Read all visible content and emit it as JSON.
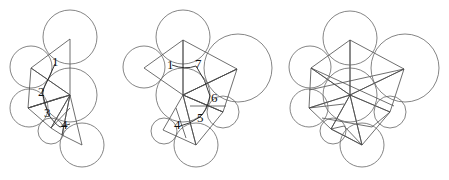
{
  "figure": {
    "colors": {
      "dark_face": "#6e6e6e",
      "light_face": "#cacaca",
      "medium_face": "#9b9b9b",
      "edge": "#4a4a4a",
      "circle": "#666666"
    },
    "panels": [
      {
        "id": "panel-1",
        "labels": [
          {
            "text": "1",
            "x": 52,
            "y": 66
          },
          {
            "text": "2",
            "x": 38,
            "y": 96
          },
          {
            "text": "3",
            "x": 44,
            "y": 117
          },
          {
            "text": "4",
            "x": 61,
            "y": 129
          }
        ]
      },
      {
        "id": "panel-2",
        "labels": [
          {
            "text": "1",
            "x": 167,
            "y": 69
          },
          {
            "text": "7",
            "x": 195,
            "y": 68
          },
          {
            "text": "6",
            "x": 211,
            "y": 102
          },
          {
            "text": "5",
            "x": 197,
            "y": 122
          },
          {
            "text": "4",
            "x": 174,
            "y": 129
          }
        ]
      },
      {
        "id": "panel-3",
        "labels": []
      }
    ]
  }
}
